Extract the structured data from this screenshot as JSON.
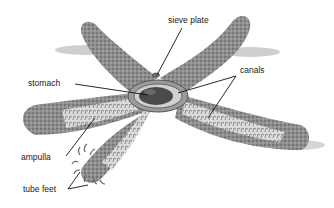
{
  "labels": {
    "sieve_plate": "sieve plate",
    "canals": "canals",
    "stomach": "stomach",
    "ampulla": "ampulla",
    "tube_feet": "tube feet"
  },
  "colors": {
    "background": "#ffffff",
    "body": "#8c8c8c",
    "body_dark": "#5a5a5a",
    "canal_light": "#d8d8d8",
    "stomach": "#4a4a4a",
    "line": "#111111",
    "shadow": "#bdbdbd"
  }
}
